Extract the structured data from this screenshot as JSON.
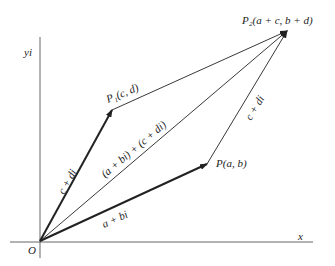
{
  "diagram": {
    "type": "complex-number-vector-addition",
    "axes": {
      "x_label": "x",
      "y_label": "yi",
      "origin_label": "O"
    },
    "points": {
      "O": {
        "label": "O",
        "x": 40,
        "y": 241
      },
      "P": {
        "label": "P(a, b)",
        "x": 207,
        "y": 164
      },
      "P1": {
        "label": "P₁(c, d)",
        "x": 112,
        "y": 110
      },
      "P2": {
        "label": "P₂(a + c, b + d)",
        "x": 287,
        "y": 31
      }
    },
    "vectors": [
      {
        "from": "O",
        "to": "P",
        "label": "a + bi",
        "bold": true
      },
      {
        "from": "O",
        "to": "P1",
        "label": "c + di",
        "bold": true
      },
      {
        "from": "O",
        "to": "P2",
        "label": "(a + bi) + (c + di)",
        "bold": false
      },
      {
        "from": "P1",
        "to": "P2",
        "label": "",
        "bold": false
      },
      {
        "from": "P",
        "to": "P2",
        "label": "c + di",
        "bold": false
      }
    ]
  }
}
